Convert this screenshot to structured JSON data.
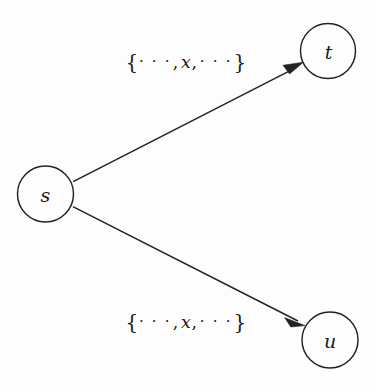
{
  "diagram": {
    "background_color": "#fdfdfd",
    "stroke_color": "#232323",
    "text_color": "#1a1a1a",
    "nodes": [
      {
        "id": "s",
        "label": "s",
        "cx": 45.5,
        "cy": 194,
        "r": 28
      },
      {
        "id": "t",
        "label": "t",
        "cx": 328,
        "cy": 51,
        "r": 27.5
      },
      {
        "id": "u",
        "label": "u",
        "cx": 330,
        "cy": 340,
        "r": 28
      }
    ],
    "edges": [
      {
        "id": "s-to-t",
        "from": "s",
        "to": "t",
        "directed": true,
        "label": {
          "open_brace": "{",
          "left_ellipsis": "· · ·",
          "comma_after_left_ellipsis": ",",
          "variable": "x",
          "comma_after_variable": ",",
          "right_ellipsis": "· · ·",
          "close_brace": "}",
          "plain_text": "{···, x, ···}",
          "x": 186,
          "y": 62
        }
      },
      {
        "id": "s-to-u",
        "from": "s",
        "to": "u",
        "directed": true,
        "label": {
          "open_brace": "{",
          "left_ellipsis": "· · ·",
          "comma_after_left_ellipsis": ",",
          "variable": "x",
          "comma_after_variable": ",",
          "right_ellipsis": "· · ·",
          "close_brace": "}",
          "plain_text": "{···, x, ···}",
          "x": 186,
          "y": 322
        }
      }
    ]
  }
}
